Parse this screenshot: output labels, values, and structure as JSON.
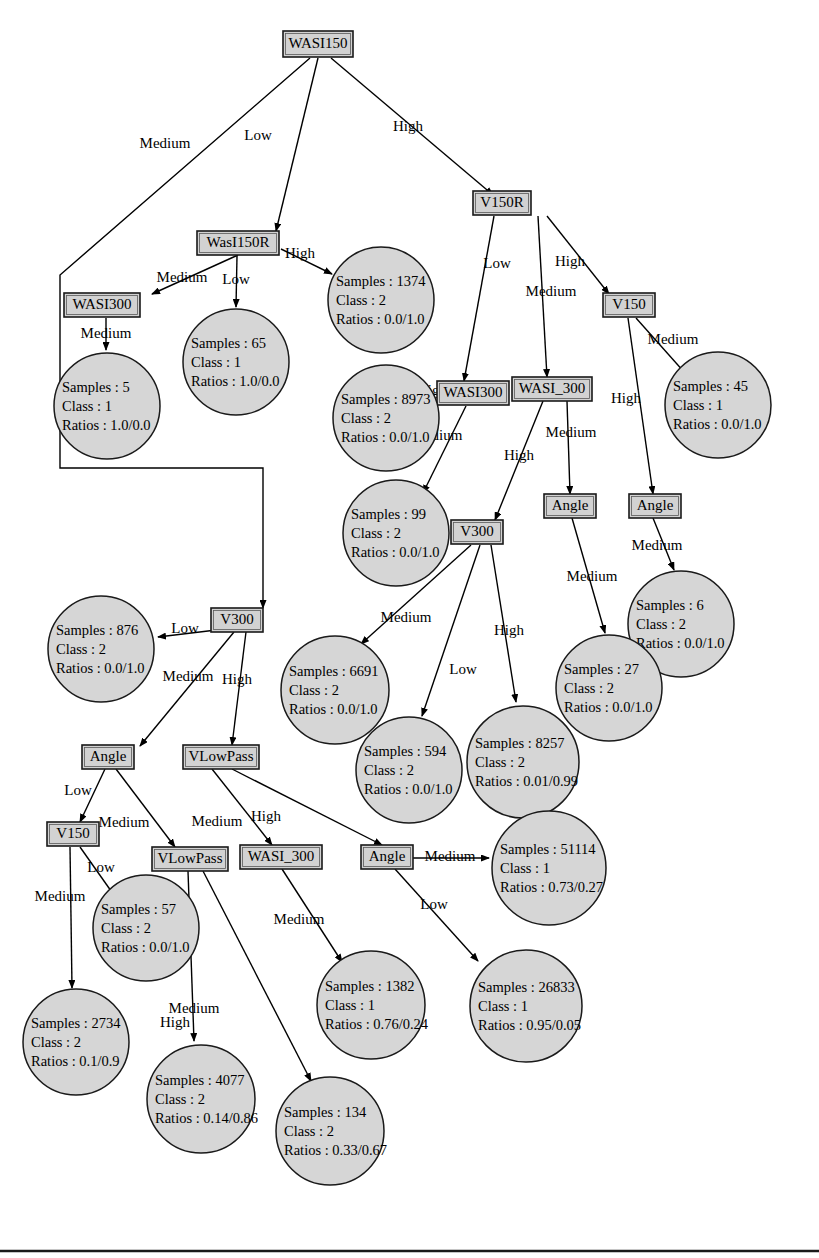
{
  "diagram": {
    "type": "decision-tree",
    "colors": {
      "node_fill": "#d2d2d2",
      "leaf_fill": "#d6d6d6",
      "stroke": "#000000",
      "background": "#ffffff"
    },
    "leaf_fields": {
      "samples_label": "Samples",
      "class_label": "Class",
      "ratios_label": "Ratios",
      "separator": " : "
    },
    "decision_nodes": [
      {
        "id": "n_wasi150",
        "label": "WASI150",
        "x": 318,
        "y": 44,
        "w": 70,
        "h": 26
      },
      {
        "id": "n_wasl150r",
        "label": "WasI150R",
        "x": 238,
        "y": 243,
        "w": 82,
        "h": 24
      },
      {
        "id": "n_wasi300_tl",
        "label": "WASI300",
        "x": 102,
        "y": 305,
        "w": 76,
        "h": 24
      },
      {
        "id": "n_v150r",
        "label": "V150R",
        "x": 502,
        "y": 203,
        "w": 58,
        "h": 24
      },
      {
        "id": "n_v150_top",
        "label": "V150",
        "x": 629,
        "y": 305,
        "w": 52,
        "h": 24
      },
      {
        "id": "n_wasi300_mid",
        "label": "WASI300",
        "x": 473,
        "y": 393,
        "w": 72,
        "h": 24
      },
      {
        "id": "n_wasi_300_mid",
        "label": "WASI_300",
        "x": 552,
        "y": 389,
        "w": 80,
        "h": 24
      },
      {
        "id": "n_angle_r1",
        "label": "Angle",
        "x": 570,
        "y": 506,
        "w": 52,
        "h": 24
      },
      {
        "id": "n_angle_r2",
        "label": "Angle",
        "x": 655,
        "y": 506,
        "w": 52,
        "h": 24
      },
      {
        "id": "n_v300_mid",
        "label": "V300",
        "x": 477,
        "y": 532,
        "w": 52,
        "h": 24
      },
      {
        "id": "n_v300_left",
        "label": "V300",
        "x": 237,
        "y": 620,
        "w": 52,
        "h": 24
      },
      {
        "id": "n_angle_l",
        "label": "Angle",
        "x": 108,
        "y": 757,
        "w": 52,
        "h": 24
      },
      {
        "id": "n_vlowpass_up",
        "label": "VLowPass",
        "x": 221,
        "y": 757,
        "w": 76,
        "h": 24
      },
      {
        "id": "n_v150_bot",
        "label": "V150",
        "x": 73,
        "y": 834,
        "w": 52,
        "h": 24
      },
      {
        "id": "n_vlowpass_low",
        "label": "VLowPass",
        "x": 190,
        "y": 859,
        "w": 76,
        "h": 24
      },
      {
        "id": "n_wasi_300_bot",
        "label": "WASI_300",
        "x": 281,
        "y": 857,
        "w": 82,
        "h": 24
      },
      {
        "id": "n_angle_bot",
        "label": "Angle",
        "x": 387,
        "y": 857,
        "w": 52,
        "h": 24
      }
    ],
    "leaf_nodes": [
      {
        "id": "l_1374",
        "samples": "1374",
        "class": "2",
        "ratios": "0.0/1.0",
        "cx": 381,
        "cy": 300,
        "r": 53
      },
      {
        "id": "l_65",
        "samples": "65",
        "class": "1",
        "ratios": "1.0/0.0",
        "cx": 236,
        "cy": 362,
        "r": 53
      },
      {
        "id": "l_5",
        "samples": "5",
        "class": "1",
        "ratios": "1.0/0.0",
        "cx": 107,
        "cy": 406,
        "r": 53
      },
      {
        "id": "l_45",
        "samples": "45",
        "class": "1",
        "ratios": "0.0/1.0",
        "cx": 718,
        "cy": 405,
        "r": 53
      },
      {
        "id": "l_8973",
        "samples": "8973",
        "class": "2",
        "ratios": "0.0/1.0",
        "cx": 386,
        "cy": 418,
        "r": 53
      },
      {
        "id": "l_99",
        "samples": "99",
        "class": "2",
        "ratios": "0.0/1.0",
        "cx": 396,
        "cy": 533,
        "r": 53
      },
      {
        "id": "l_6",
        "samples": "6",
        "class": "2",
        "ratios": "0.0/1.0",
        "cx": 681,
        "cy": 624,
        "r": 53
      },
      {
        "id": "l_876",
        "samples": "876",
        "class": "2",
        "ratios": "0.0/1.0",
        "cx": 101,
        "cy": 649,
        "r": 53
      },
      {
        "id": "l_6691",
        "samples": "6691",
        "class": "2",
        "ratios": "0.0/1.0",
        "cx": 335,
        "cy": 690,
        "r": 54
      },
      {
        "id": "l_27",
        "samples": "27",
        "class": "2",
        "ratios": "0.0/1.0",
        "cx": 609,
        "cy": 688,
        "r": 53
      },
      {
        "id": "l_8257",
        "samples": "8257",
        "class": "2",
        "ratios": "0.01/0.99",
        "cx": 523,
        "cy": 762,
        "r": 56
      },
      {
        "id": "l_594",
        "samples": "594",
        "class": "2",
        "ratios": "0.0/1.0",
        "cx": 409,
        "cy": 770,
        "r": 53
      },
      {
        "id": "l_51114",
        "samples": "51114",
        "class": "1",
        "ratios": "0.73/0.27",
        "cx": 549,
        "cy": 868,
        "r": 57
      },
      {
        "id": "l_57",
        "samples": "57",
        "class": "2",
        "ratios": "0.0/1.0",
        "cx": 146,
        "cy": 928,
        "r": 53
      },
      {
        "id": "l_2734",
        "samples": "2734",
        "class": "2",
        "ratios": "0.1/0.9",
        "cx": 76,
        "cy": 1042,
        "r": 53
      },
      {
        "id": "l_1382",
        "samples": "1382",
        "class": "1",
        "ratios": "0.76/0.24",
        "cx": 371,
        "cy": 1005,
        "r": 54
      },
      {
        "id": "l_26833",
        "samples": "26833",
        "class": "1",
        "ratios": "0.95/0.05",
        "cx": 526,
        "cy": 1006,
        "r": 56
      },
      {
        "id": "l_4077",
        "samples": "4077",
        "class": "2",
        "ratios": "0.14/0.86",
        "cx": 201,
        "cy": 1099,
        "r": 54
      },
      {
        "id": "l_134",
        "samples": "134",
        "class": "2",
        "ratios": "0.33/0.67",
        "cx": 330,
        "cy": 1131,
        "r": 54
      }
    ],
    "edges": [
      {
        "id": "e1",
        "from": "n_wasi150",
        "to": "n_v300_left",
        "label": "Medium",
        "lx": 165,
        "ly": 145,
        "path": "M 310,58 L 60,275 L 60,468 L 263,468 L 263,608",
        "arrow": "down"
      },
      {
        "id": "e2",
        "from": "n_wasi150",
        "to": "n_wasl150r",
        "label": "Low",
        "lx": 258,
        "ly": 137,
        "path": "M 318,58 L 276,231",
        "arrow": "down"
      },
      {
        "id": "e3",
        "from": "n_wasi150",
        "to": "n_v150r",
        "label": "High",
        "lx": 408,
        "ly": 128,
        "path": "M 331,58 L 493,195",
        "arrow": "down"
      },
      {
        "id": "e4",
        "from": "n_wasl150r",
        "to": "n_wasi300_tl",
        "label": "Medium",
        "lx": 182,
        "ly": 279,
        "path": "M 238,255 L 152,294",
        "arrow": "down"
      },
      {
        "id": "e5",
        "from": "n_wasl150r",
        "to": "l_65",
        "label": "Low",
        "lx": 236,
        "ly": 281,
        "path": "M 237,256 L 236,307",
        "arrow": "down"
      },
      {
        "id": "e6",
        "from": "n_wasl150r",
        "to": "l_1374",
        "label": "High",
        "lx": 300,
        "ly": 255,
        "path": "M 281,249 L 332,274",
        "arrow": "down"
      },
      {
        "id": "e7",
        "from": "n_wasi300_tl",
        "to": "l_5",
        "label": "Medium",
        "lx": 106,
        "ly": 335,
        "path": "M 106,318 L 106,350",
        "arrow": "down"
      },
      {
        "id": "e8",
        "from": "n_v150r",
        "to": "n_wasi300_mid",
        "label": "Low",
        "lx": 497,
        "ly": 265,
        "path": "M 494,216 L 464,381",
        "arrow": "down"
      },
      {
        "id": "e9",
        "from": "n_v150r",
        "to": "n_wasi_300_mid",
        "label": "Medium",
        "lx": 551,
        "ly": 293,
        "path": "M 538,216 L 547,377",
        "arrow": "down"
      },
      {
        "id": "e10",
        "from": "n_v150r",
        "to": "n_v150_top",
        "label": "High",
        "lx": 570,
        "ly": 263,
        "path": "M 547,216 L 609,294",
        "arrow": "down"
      },
      {
        "id": "e11",
        "from": "n_v150_top",
        "to": "l_45",
        "label": "Medium",
        "lx": 673,
        "ly": 341,
        "path": "M 636,318 L 693,382",
        "arrow": "down"
      },
      {
        "id": "e12",
        "from": "n_v150_top",
        "to": "n_angle_r2",
        "label": "High",
        "lx": 626,
        "ly": 400,
        "path": "M 628,318 L 653,494",
        "arrow": "down"
      },
      {
        "id": "e13",
        "from": "n_wasi300_mid",
        "to": "l_8973",
        "label": "High",
        "lx": 432,
        "ly": 392,
        "path": "M 464,396 L 424,405",
        "arrow": "down"
      },
      {
        "id": "e14",
        "from": "n_wasi300_mid",
        "to": "l_99",
        "label": "Medium",
        "lx": 437,
        "ly": 437,
        "path": "M 466,406 L 423,493",
        "arrow": "down"
      },
      {
        "id": "e15",
        "from": "n_wasi_300_mid",
        "to": "n_v300_mid",
        "label": "High",
        "lx": 519,
        "ly": 457,
        "path": "M 543,401 L 495,520",
        "arrow": "down"
      },
      {
        "id": "e16",
        "from": "n_wasi_300_mid",
        "to": "n_angle_r1",
        "label": "Medium",
        "lx": 571,
        "ly": 434,
        "path": "M 567,401 L 570,494",
        "arrow": "down"
      },
      {
        "id": "e17",
        "from": "n_angle_r1",
        "to": "l_27",
        "label": "Medium",
        "lx": 592,
        "ly": 578,
        "path": "M 572,518 L 605,633",
        "arrow": "down"
      },
      {
        "id": "e18",
        "from": "n_angle_r2",
        "to": "l_6",
        "label": "Medium",
        "lx": 657,
        "ly": 547,
        "path": "M 653,518 L 674,570",
        "arrow": "down"
      },
      {
        "id": "e19",
        "from": "n_v300_mid",
        "to": "l_6691",
        "label": "Medium",
        "lx": 406,
        "ly": 619,
        "path": "M 471,545 L 361,644",
        "arrow": "down"
      },
      {
        "id": "e20",
        "from": "n_v300_mid",
        "to": "l_594",
        "label": "Low",
        "lx": 463,
        "ly": 671,
        "path": "M 480,545 L 422,716",
        "arrow": "down"
      },
      {
        "id": "e21",
        "from": "n_v300_mid",
        "to": "l_8257",
        "label": "High",
        "lx": 509,
        "ly": 632,
        "path": "M 491,545 L 516,702",
        "arrow": "down"
      },
      {
        "id": "e22",
        "from": "n_v300_left",
        "to": "l_876",
        "label": "Low",
        "lx": 185,
        "ly": 630,
        "path": "M 233,628 L 158,637",
        "arrow": "left"
      },
      {
        "id": "e23",
        "from": "n_v300_left",
        "to": "n_angle_l",
        "label": "Medium",
        "lx": 188,
        "ly": 678,
        "path": "M 234,632 L 140,746",
        "arrow": "down"
      },
      {
        "id": "e24",
        "from": "n_v300_left",
        "to": "n_vlowpass_up",
        "label": "High",
        "lx": 237,
        "ly": 681,
        "path": "M 246,632 L 232,745",
        "arrow": "down"
      },
      {
        "id": "e25",
        "from": "n_angle_l",
        "to": "n_v150_bot",
        "label": "Low",
        "lx": 78,
        "ly": 792,
        "path": "M 105,769 L 80,822",
        "arrow": "down"
      },
      {
        "id": "e26",
        "from": "n_angle_l",
        "to": "n_vlowpass_low",
        "label": "Medium",
        "lx": 124,
        "ly": 824,
        "path": "M 116,769 L 175,847",
        "arrow": "down"
      },
      {
        "id": "e27",
        "from": "n_vlowpass_up",
        "to": "n_wasi_300_bot",
        "label": "Medium",
        "lx": 217,
        "ly": 823,
        "path": "M 212,769 L 272,845",
        "arrow": "down"
      },
      {
        "id": "e28",
        "from": "n_vlowpass_up",
        "to": "n_angle_bot",
        "label": "High",
        "lx": 266,
        "ly": 818,
        "path": "M 232,769 L 382,845",
        "arrow": "down"
      },
      {
        "id": "e29",
        "from": "n_v150_bot",
        "to": "l_2734",
        "label": "Medium",
        "lx": 60,
        "ly": 898,
        "path": "M 70,847 L 72,988",
        "arrow": "down"
      },
      {
        "id": "e30",
        "from": "n_v150_bot",
        "to": "l_57",
        "label": "Low",
        "lx": 101,
        "ly": 869,
        "path": "M 80,847 L 116,898",
        "arrow": "down"
      },
      {
        "id": "e31",
        "from": "n_vlowpass_low",
        "to": "l_4077",
        "label": "Medium",
        "lx": 194,
        "ly": 1010,
        "path": "M 188,871 L 194,1041",
        "arrow": "down"
      },
      {
        "id": "e32",
        "from": "n_vlowpass_low",
        "to": "l_134",
        "label": "High",
        "lx": 175,
        "ly": 1024,
        "path": "M 203,871 L 311,1081",
        "arrow": "down"
      },
      {
        "id": "e33",
        "from": "n_wasi_300_bot",
        "to": "l_1382",
        "label": "Medium",
        "lx": 299,
        "ly": 921,
        "path": "M 282,869 L 342,962",
        "arrow": "down"
      },
      {
        "id": "e34",
        "from": "n_angle_bot",
        "to": "l_51114",
        "label": "Medium",
        "lx": 450,
        "ly": 858,
        "path": "M 413,858 L 489,858",
        "arrow": "right"
      },
      {
        "id": "e35",
        "from": "n_angle_bot",
        "to": "l_26833",
        "label": "Low",
        "lx": 434,
        "ly": 906,
        "path": "M 395,869 L 478,961",
        "arrow": "down"
      }
    ],
    "footer": {
      "rule_y": 1251
    }
  }
}
